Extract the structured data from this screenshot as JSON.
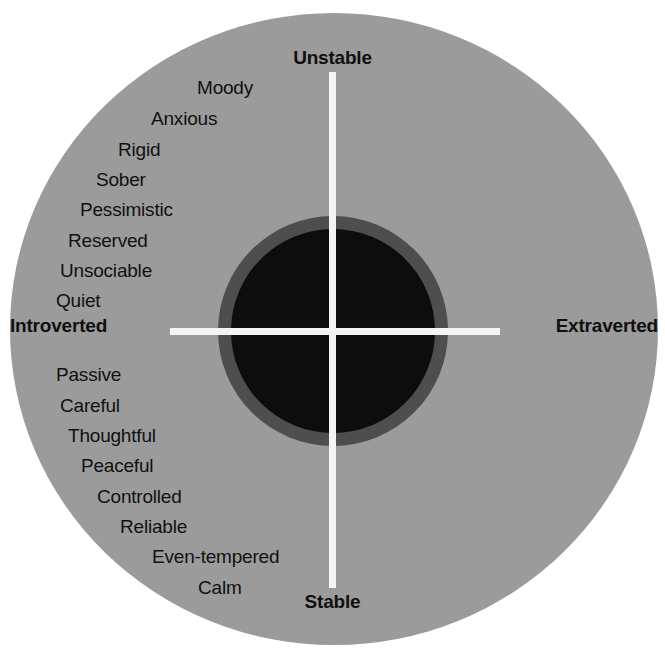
{
  "diagram": {
    "title_visible": false,
    "colors": {
      "background": "#ffffff",
      "outer_ring": "#9b9b9b",
      "mid_ring": "#4e4e4e",
      "core": "#0d0d0d",
      "axis_line": "#f4f4f4",
      "text": "#111111"
    },
    "axes": {
      "vertical": {
        "top_label": "Unstable",
        "bottom_label": "Stable"
      },
      "horizontal": {
        "left_label": "Introverted",
        "right_label": "Extraverted"
      }
    },
    "quadrants": [
      {
        "id": "unstable-introverted",
        "name": "Melancholic",
        "align": "left",
        "traits": [
          {
            "label": "Moody",
            "x": 197,
            "y": 78
          },
          {
            "label": "Anxious",
            "x": 151,
            "y": 109
          },
          {
            "label": "Rigid",
            "x": 118,
            "y": 140
          },
          {
            "label": "Sober",
            "x": 96,
            "y": 170
          },
          {
            "label": "Pessimistic",
            "x": 80,
            "y": 200
          },
          {
            "label": "Reserved",
            "x": 68,
            "y": 231
          },
          {
            "label": "Unsociable",
            "x": 60,
            "y": 261
          },
          {
            "label": "Quiet",
            "x": 56,
            "y": 291
          }
        ]
      },
      {
        "id": "unstable-extraverted",
        "name": "Choleric",
        "align": "right",
        "traits": [
          {
            "label": "Touchy",
            "xr": 196,
            "y": 78
          },
          {
            "label": "Restless",
            "xr": 152,
            "y": 109
          },
          {
            "label": "Aggressive",
            "xr": 117,
            "y": 140
          },
          {
            "label": "Excitable",
            "xr": 94,
            "y": 170
          },
          {
            "label": "Changeable",
            "xr": 78,
            "y": 200
          },
          {
            "label": "Impulsive",
            "xr": 66,
            "y": 231
          },
          {
            "label": "Optimistic",
            "xr": 58,
            "y": 261
          },
          {
            "label": "Active",
            "xr": 54,
            "y": 291
          }
        ]
      },
      {
        "id": "stable-introverted",
        "name": "Phlegmatic",
        "align": "left",
        "traits": [
          {
            "label": "Passive",
            "x": 56,
            "y": 365
          },
          {
            "label": "Careful",
            "x": 60,
            "y": 396
          },
          {
            "label": "Thoughtful",
            "x": 68,
            "y": 426
          },
          {
            "label": "Peaceful",
            "x": 81,
            "y": 456
          },
          {
            "label": "Controlled",
            "x": 97,
            "y": 487
          },
          {
            "label": "Reliable",
            "x": 120,
            "y": 517
          },
          {
            "label": "Even-tempered",
            "x": 152,
            "y": 547
          },
          {
            "label": "Calm",
            "x": 198,
            "y": 578
          }
        ]
      },
      {
        "id": "stable-extraverted",
        "name": "Sanguine",
        "align": "right",
        "traits": [
          {
            "label": "Sociable",
            "xr": 55,
            "y": 365
          },
          {
            "label": "Outgoing",
            "xr": 58,
            "y": 396
          },
          {
            "label": "Talkative",
            "xr": 66,
            "y": 426
          },
          {
            "label": "Responsive",
            "xr": 79,
            "y": 456
          },
          {
            "label": "Easygoing",
            "xr": 95,
            "y": 487
          },
          {
            "label": "Lively",
            "xr": 118,
            "y": 517
          },
          {
            "label": "Carefree",
            "xr": 150,
            "y": 547
          },
          {
            "label": "Leadership",
            "xr": 196,
            "y": 578
          }
        ]
      }
    ]
  }
}
